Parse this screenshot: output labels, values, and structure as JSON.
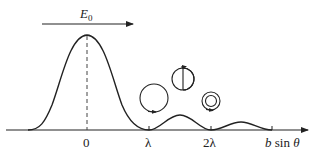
{
  "diagram": {
    "field_arrow_label": "E",
    "field_arrow_subscript": "0",
    "axis": {
      "label_b": "b",
      "label_rest": " sin ",
      "label_theta": "θ",
      "ticks": [
        {
          "label": "0",
          "x": 87
        },
        {
          "label": "λ",
          "x": 149
        },
        {
          "label": "2λ",
          "x": 211
        }
      ]
    },
    "phasors": [
      {
        "name": "closed-circle",
        "description": "phasor circle closes at first minimum"
      },
      {
        "name": "one-and-half-turn",
        "description": "phasor curls 1.5 turns at first secondary maximum"
      },
      {
        "name": "double-spiral",
        "description": "phasor curls twice at second minimum"
      }
    ],
    "colors": {
      "stroke": "#222222",
      "background": "#ffffff"
    }
  }
}
